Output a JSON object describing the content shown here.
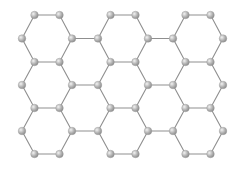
{
  "diagram": {
    "atom_color": "#b5b5b5",
    "atom_highlight": "#f2f2f2",
    "bond_color": "#8f8f8f",
    "background": "#ffffff",
    "lattice": {
      "hexagon_orientation": "flat-top",
      "hexagon_columns": 3,
      "hexagon_rows": 3,
      "interleaved_columns": 2,
      "interleaved_rows": 2
    }
  }
}
